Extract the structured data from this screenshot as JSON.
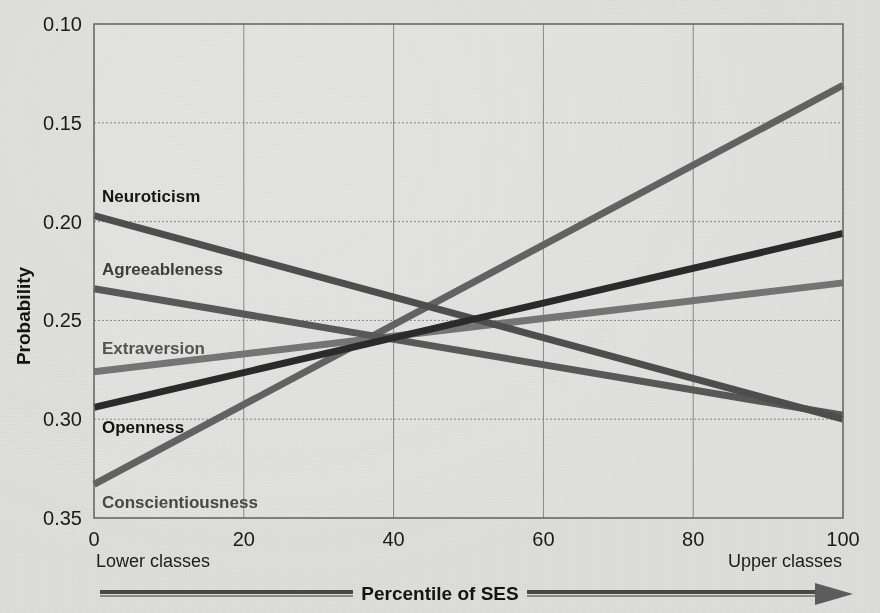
{
  "figure": {
    "background_color": "#e2e2e0",
    "plot_background_color": "#e4e4e2",
    "frame_color": "#6b6b6b",
    "grid_color": "#8a8a8a"
  },
  "axes": {
    "y_title": "Probability",
    "x_title": "Percentile of SES",
    "x_left_caption": "Lower classes",
    "x_right_caption": "Upper classes",
    "y_ticks": [
      "0.35",
      "0.30",
      "0.25",
      "0.20",
      "0.15",
      "0.10"
    ],
    "x_ticks": [
      "0",
      "20",
      "40",
      "60",
      "80",
      "100"
    ]
  },
  "chart_data": {
    "type": "line",
    "title": "",
    "xlabel": "Percentile of SES",
    "ylabel": "Probability",
    "xlim": [
      0,
      100
    ],
    "ylim": [
      0.1,
      0.35
    ],
    "x_ticks": [
      0,
      20,
      40,
      60,
      80,
      100
    ],
    "y_ticks": [
      0.1,
      0.15,
      0.2,
      0.25,
      0.3,
      0.35
    ],
    "grid": true,
    "legend": "inline-labels-left",
    "x": [
      0,
      100
    ],
    "series": [
      {
        "name": "Neuroticism",
        "values": [
          0.253,
          0.15
        ],
        "color": "#4f4f4f",
        "label_color": "#161616",
        "label_x": 0,
        "label_y": 0.263,
        "width": 7
      },
      {
        "name": "Agreeableness",
        "values": [
          0.216,
          0.152
        ],
        "color": "#5a5a5a",
        "label_color": "#3e3e3e",
        "label_x": 0,
        "label_y": 0.226,
        "width": 7
      },
      {
        "name": "Extraversion",
        "values": [
          0.174,
          0.219
        ],
        "color": "#777777",
        "label_color": "#545454",
        "label_x": 0,
        "label_y": 0.186,
        "width": 7
      },
      {
        "name": "Openness",
        "values": [
          0.156,
          0.244
        ],
        "color": "#2b2b2b",
        "label_color": "#121212",
        "label_x": 0,
        "label_y": 0.146,
        "width": 7
      },
      {
        "name": "Conscientiousness",
        "values": [
          0.117,
          0.319
        ],
        "color": "#646464",
        "label_color": "#494949",
        "label_x": 0,
        "label_y": 0.108,
        "width": 7
      }
    ],
    "annotations": [
      {
        "text": "Lower classes",
        "position": "below-axis-left"
      },
      {
        "text": "Upper classes",
        "position": "below-axis-right"
      },
      {
        "text": "Percentile of SES",
        "position": "arrow-center"
      }
    ]
  }
}
